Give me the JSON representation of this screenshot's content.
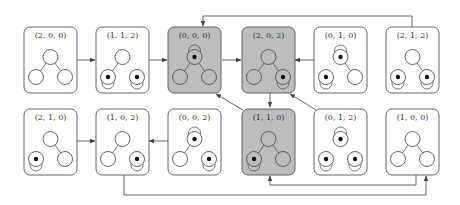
{
  "diagram": {
    "type": "state-transition-diagram",
    "colors": {
      "box_default": "#ffffff",
      "box_highlight": "#bdbdbd",
      "stroke": "#555555",
      "token": "#111111"
    },
    "nodes": [
      {
        "id": "n200",
        "label": "(2, 0, 0)",
        "row": 0,
        "col": 0,
        "highlight": false,
        "vertices": {
          "top": {
            "token": false,
            "loop": false
          },
          "left": {
            "token": false,
            "loop": false
          },
          "right": {
            "token": false,
            "loop": false
          }
        },
        "edges": [
          "top-left",
          "top-right"
        ]
      },
      {
        "id": "n112",
        "label": "(1, 1, 2)",
        "row": 0,
        "col": 1,
        "highlight": false,
        "vertices": {
          "top": {
            "token": false,
            "loop": false
          },
          "left": {
            "token": true,
            "loop": true
          },
          "right": {
            "token": true,
            "loop": true
          }
        },
        "edges": [
          "top-left"
        ]
      },
      {
        "id": "n000",
        "label": "(0, 0, 0)",
        "row": 0,
        "col": 2,
        "highlight": true,
        "vertices": {
          "top": {
            "token": true,
            "loop": true
          },
          "left": {
            "token": false,
            "loop": false
          },
          "right": {
            "token": false,
            "loop": false
          }
        },
        "edges": [
          "top-left",
          "top-right"
        ]
      },
      {
        "id": "n202",
        "label": "(2, 0, 2)",
        "row": 0,
        "col": 3,
        "highlight": true,
        "vertices": {
          "top": {
            "token": false,
            "loop": false
          },
          "left": {
            "token": false,
            "loop": false
          },
          "right": {
            "token": true,
            "loop": true
          }
        },
        "edges": [
          "top-left",
          "top-right"
        ]
      },
      {
        "id": "n010",
        "label": "(0, 1, 0)",
        "row": 0,
        "col": 4,
        "highlight": false,
        "vertices": {
          "top": {
            "token": true,
            "loop": true
          },
          "left": {
            "token": true,
            "loop": true
          },
          "right": {
            "token": false,
            "loop": false
          }
        },
        "edges": [
          "top-right"
        ]
      },
      {
        "id": "n212",
        "label": "(2, 1, 2)",
        "row": 0,
        "col": 5,
        "highlight": false,
        "vertices": {
          "top": {
            "token": false,
            "loop": false
          },
          "left": {
            "token": true,
            "loop": true
          },
          "right": {
            "token": true,
            "loop": true
          }
        },
        "edges": [
          "top-right"
        ]
      },
      {
        "id": "n210",
        "label": "(2, 1, 0)",
        "row": 1,
        "col": 0,
        "highlight": false,
        "vertices": {
          "top": {
            "token": false,
            "loop": false
          },
          "left": {
            "token": true,
            "loop": true
          },
          "right": {
            "token": false,
            "loop": false
          }
        },
        "edges": [
          "top-right"
        ]
      },
      {
        "id": "n102",
        "label": "(1, 0, 2)",
        "row": 1,
        "col": 1,
        "highlight": false,
        "vertices": {
          "top": {
            "token": false,
            "loop": false
          },
          "left": {
            "token": false,
            "loop": false
          },
          "right": {
            "token": true,
            "loop": true
          }
        },
        "edges": [
          "top-left"
        ]
      },
      {
        "id": "n002",
        "label": "(0, 0, 2)",
        "row": 1,
        "col": 2,
        "highlight": false,
        "vertices": {
          "top": {
            "token": true,
            "loop": true
          },
          "left": {
            "token": false,
            "loop": false
          },
          "right": {
            "token": true,
            "loop": true
          }
        },
        "edges": [
          "top-left"
        ]
      },
      {
        "id": "n110",
        "label": "(1, 1, 0)",
        "row": 1,
        "col": 3,
        "highlight": true,
        "vertices": {
          "top": {
            "token": false,
            "loop": false
          },
          "left": {
            "token": true,
            "loop": true
          },
          "right": {
            "token": false,
            "loop": false
          }
        },
        "edges": [
          "top-left",
          "top-right"
        ]
      },
      {
        "id": "n012",
        "label": "(0, 1, 2)",
        "row": 1,
        "col": 4,
        "highlight": false,
        "vertices": {
          "top": {
            "token": true,
            "loop": true
          },
          "left": {
            "token": true,
            "loop": true
          },
          "right": {
            "token": true,
            "loop": true
          }
        },
        "edges": []
      },
      {
        "id": "n100",
        "label": "(1, 0, 0)",
        "row": 1,
        "col": 5,
        "highlight": false,
        "vertices": {
          "top": {
            "token": false,
            "loop": false
          },
          "left": {
            "token": false,
            "loop": false
          },
          "right": {
            "token": false,
            "loop": false
          }
        },
        "edges": [
          "top-left",
          "top-right"
        ]
      }
    ],
    "transitions": [
      {
        "from": "(2, 0, 0)",
        "to": "(1, 1, 2)"
      },
      {
        "from": "(1, 1, 2)",
        "to": "(0, 0, 0)"
      },
      {
        "from": "(0, 0, 0)",
        "to": "(2, 0, 2)"
      },
      {
        "from": "(0, 1, 0)",
        "to": "(2, 0, 2)"
      },
      {
        "from": "(2, 1, 2)",
        "to": "(0, 0, 0)"
      },
      {
        "from": "(2, 0, 2)",
        "to": "(1, 1, 0)"
      },
      {
        "from": "(1, 1, 0)",
        "to": "(0, 0, 0)"
      },
      {
        "from": "(0, 1, 2)",
        "to": "(2, 0, 2)"
      },
      {
        "from": "(2, 1, 0)",
        "to": "(1, 0, 2)"
      },
      {
        "from": "(0, 0, 2)",
        "to": "(1, 0, 2)"
      },
      {
        "from": "(0, 1, 0)",
        "to": "(1, 1, 0)"
      },
      {
        "from": "(1, 0, 2)",
        "to": "(1, 0, 0)"
      },
      {
        "from": "(0, 1, 2)",
        "to": "(1, 1, 0)"
      }
    ]
  }
}
